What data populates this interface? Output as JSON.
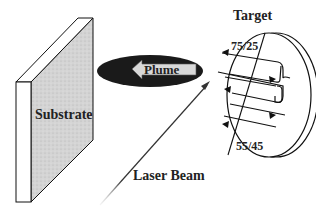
{
  "diagram": {
    "labels": {
      "substrate": "Substrate",
      "plume": "Plume",
      "target": "Target",
      "laser_beam": "Laser Beam",
      "composition_top": "75/25",
      "composition_bottom": "55/45"
    },
    "colors": {
      "outline": "#111111",
      "substrate_fill": "#cfcfcf",
      "plume_fill": "#1a1a1a",
      "arrow_fill": "#d8d8d8",
      "text": "#222222"
    }
  }
}
